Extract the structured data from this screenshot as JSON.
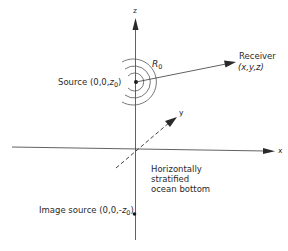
{
  "diagram": {
    "type": "coordinate-geometry",
    "axes": {
      "x": {
        "label": "x"
      },
      "y": {
        "label": "y"
      },
      "z": {
        "label": "z"
      }
    },
    "source": {
      "name": "Source",
      "coords_prefix": "(0,0,",
      "coord_var": "z",
      "coord_sub": "0",
      "coords_suffix": ")"
    },
    "receiver": {
      "name": "Receiver",
      "coords": "(x,y,z)"
    },
    "distance": {
      "symbol": "R",
      "sub": "0"
    },
    "image_source": {
      "name": "Image source",
      "coords_prefix": "(0,0,-",
      "coord_var": "z",
      "coord_sub": "0",
      "coords_suffix": ")"
    },
    "boundary": {
      "lines": [
        "Horizontally",
        "stratified",
        "ocean bottom"
      ]
    },
    "colors": {
      "line": "#3a3a3a",
      "arc": "#555555",
      "text": "#2a2a2a",
      "background": "#ffffff"
    }
  }
}
